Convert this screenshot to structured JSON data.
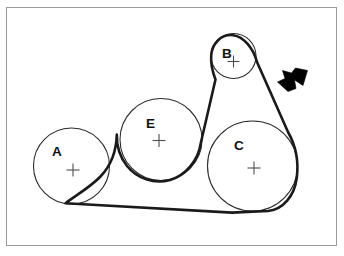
{
  "figure": {
    "kind": "belt-and-pulley-diagram",
    "background_color": "#ffffff",
    "frame": {
      "x": 6,
      "y": 7,
      "width": 331,
      "height": 239,
      "border_color": "#9a9a9a",
      "border_width": 1
    },
    "belt": {
      "color": "#1a1a1a",
      "width": 2.6,
      "path": "M 65.5 203.2 L 232 212.6 L 268 211.0 C 283 209.6 294.5 196 296.8 177.5 C 298.6 163 296.0 146 288.0 132.0 L 257.0 62.0 C 253.5 49.0 244.0 36.5 233.0 35.2 C 221.0 33.8 212.0 44.0 211.2 55.5 C 210.6 64.0 212.6 72.0 215.5 79.5 L 200.8 143.0 C 198.4 160.0 186.0 175.5 170.0 180.0 C 154.0 184.5 137.0 178.5 127.0 166.0 C 120.0 157.0 116.5 145.5 116.8 134.5 C 116.4 150.0 111.0 165.5 100.5 176.5 C 91.0 186.5 78.0 194.0 65.5 203.2 Z"
    },
    "pulleys": [
      {
        "id": "A",
        "label": "A",
        "cx": 71.5,
        "cy": 166.0,
        "r": 38.0,
        "label_x": 52.0,
        "label_y": 156.0,
        "cross_x": 73.0,
        "cross_y": 170.0,
        "cross_size": 6.5
      },
      {
        "id": "E",
        "label": "E",
        "cx": 161.0,
        "cy": 139.5,
        "r": 41.0,
        "label_x": 146.0,
        "label_y": 128.0,
        "cross_x": 159.0,
        "cross_y": 140.5,
        "cross_size": 6.5
      },
      {
        "id": "B",
        "label": "B",
        "cx": 233.5,
        "cy": 56.0,
        "r": 22.5,
        "label_x": 222.0,
        "label_y": 58.0,
        "cross_x": 233.5,
        "cross_y": 61.5,
        "cross_size": 6.0
      },
      {
        "id": "C",
        "label": "C",
        "cx": 252.5,
        "cy": 166.0,
        "r": 45.0,
        "label_x": 234.0,
        "label_y": 150.0,
        "cross_x": 254.0,
        "cross_y": 168.0,
        "cross_size": 6.5
      }
    ],
    "outline_color": "#2b2b2b",
    "cross_color": "#4d4d4d",
    "label_color": "#111111",
    "arrow": {
      "color": "#000000",
      "points": "307.5,70.5 303.0,85.5 294.5,80.0 296.0,88.5 288.0,91.5 277.5,82.0 285.0,78.5 282.5,70.5 291.5,73.0 295.5,68.0",
      "tip_x": 277.5,
      "tip_y": 82.0,
      "direction": "down-left"
    }
  }
}
